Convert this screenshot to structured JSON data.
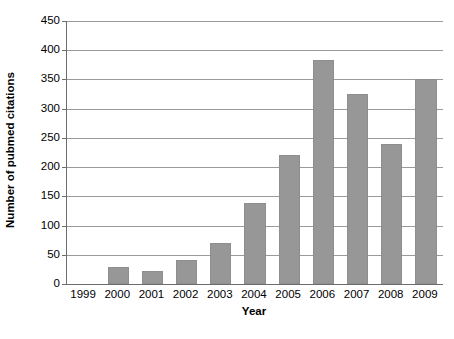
{
  "chart_data": {
    "type": "bar",
    "title": "",
    "subtitle": "",
    "xlabel": "Year",
    "ylabel": "Number of pubmed citations",
    "categories": [
      "1999",
      "2000",
      "2001",
      "2002",
      "2003",
      "2004",
      "2005",
      "2006",
      "2007",
      "2008",
      "2009"
    ],
    "values": [
      0,
      29,
      23,
      41,
      70,
      138,
      220,
      383,
      325,
      240,
      350
    ],
    "series": [
      {
        "name": "Number of pubmed citations",
        "values": [
          0,
          29,
          23,
          41,
          70,
          138,
          220,
          383,
          325,
          240,
          350
        ]
      }
    ],
    "ylim": [
      0,
      450
    ],
    "yticks": [
      0,
      50,
      100,
      150,
      200,
      250,
      300,
      350,
      400,
      450
    ],
    "ytick_labels": [
      "0",
      "50",
      "100",
      "150",
      "200",
      "250",
      "300",
      "350",
      "400",
      "450"
    ],
    "grid": "horizontal",
    "legend": "none",
    "bar_color": "#979797",
    "grid_color": "#9a9a9a",
    "axis_color": "#6d6d6d",
    "annotations": []
  },
  "caption": {
    "text": ""
  }
}
